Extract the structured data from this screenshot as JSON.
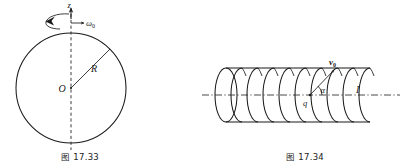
{
  "page": {
    "background_color": "#ffffff",
    "ink_color": "#1a1a1a",
    "width": 402,
    "height": 167
  },
  "figures": [
    {
      "id": "figure-17-33",
      "caption": "图 17.33",
      "type": "rotating-sphere-diagram",
      "description": "A circle (uniformly charged sphere cross-section) rotating about a vertical z axis through its center",
      "labels": {
        "axis": "z",
        "angular_velocity": "ω",
        "angular_velocity_sub": "0",
        "center": "O",
        "radius": "R"
      },
      "geometry": {
        "center_x": 71,
        "center_y": 88,
        "radius": 55,
        "axis_top_y": 6,
        "axis_bottom_y": 150,
        "radius_line_angle_deg": 45
      }
    },
    {
      "id": "figure-17-34",
      "caption": "图 17.34",
      "type": "solenoid-diagram",
      "description": "A long solenoid carrying current I, with a charge q inside moving at velocity v0 at angle alpha to the axis",
      "labels": {
        "velocity": "v",
        "velocity_sub": "0",
        "charge": "q",
        "angle": "α",
        "current": "I"
      },
      "geometry": {
        "axis_y": 95,
        "axis_left_x": 202,
        "axis_right_x": 400,
        "coil_first_cx": 226,
        "coil_last_cx": 370,
        "turns": 10,
        "ellipse_rx": 11,
        "ellipse_ry": 27,
        "charge_x": 310,
        "charge_y": 95,
        "velocity_tip_x": 334,
        "velocity_tip_y": 70
      }
    }
  ]
}
